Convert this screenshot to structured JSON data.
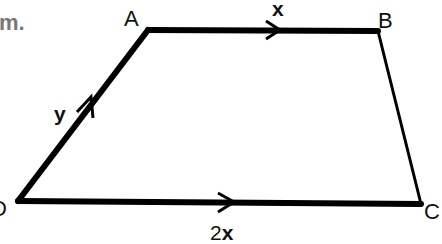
{
  "caption_fragment": "m.",
  "diagram": {
    "type": "trapezium",
    "vertices": {
      "A": {
        "label": "A",
        "x": 148,
        "y": 29
      },
      "B": {
        "label": "B",
        "x": 377,
        "y": 30
      },
      "C": {
        "label": "C",
        "x": 421,
        "y": 204
      },
      "D": {
        "label": "D",
        "x": 18,
        "y": 201
      }
    },
    "edges": [
      {
        "from": "A",
        "to": "B",
        "vector_label": "x",
        "arrow": true
      },
      {
        "from": "D",
        "to": "A",
        "vector_label": "y",
        "arrow": true
      },
      {
        "from": "D",
        "to": "C",
        "vector_label_coef": "2",
        "vector_label_var": "x",
        "arrow": true
      },
      {
        "from": "B",
        "to": "C",
        "arrow": false
      }
    ],
    "colors": {
      "stroke": "#000000",
      "background": "#ffffff",
      "caption": "#777777"
    }
  }
}
